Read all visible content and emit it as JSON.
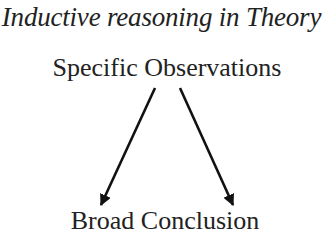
{
  "diagram": {
    "title": "Inductive reasoning in Theory",
    "top_node": "Specific Observations",
    "bottom_node": "Broad Conclusion",
    "edges": [
      {
        "from": "Specific Observations",
        "to": "Broad Conclusion",
        "side": "left"
      },
      {
        "from": "Specific Observations",
        "to": "Broad Conclusion",
        "side": "right"
      }
    ],
    "colors": {
      "text": "#222222",
      "arrow": "#111111",
      "background": "#ffffff"
    }
  }
}
